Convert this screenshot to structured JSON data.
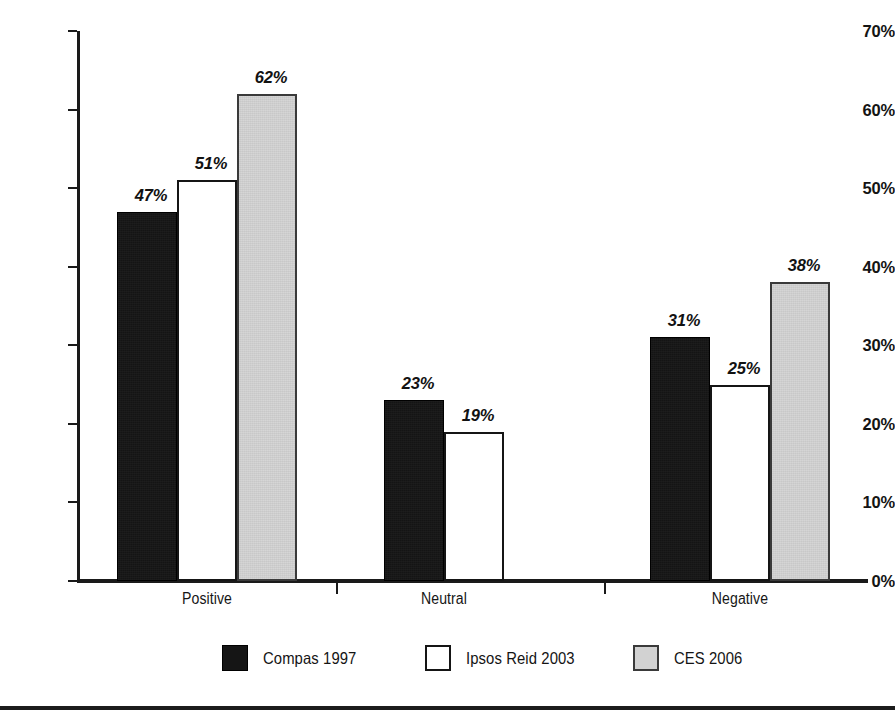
{
  "chart_data": {
    "type": "bar",
    "title": "",
    "subtitle": "",
    "xlabel": "",
    "ylabel": "",
    "categories": [
      "Positive",
      "Neutral",
      "Negative"
    ],
    "ylim": [
      0,
      70
    ],
    "y_tick_labels": [
      "0%",
      "10%",
      "20%",
      "30%",
      "40%",
      "50%",
      "60%",
      "70%"
    ],
    "y_tick_values": [
      0,
      10,
      20,
      30,
      40,
      50,
      60,
      70
    ],
    "y_axis_unit": "%",
    "grid": false,
    "legend_position": "bottom",
    "series": [
      {
        "name": "Compas 1997",
        "swatch": "black",
        "color": "#151515",
        "values": [
          47,
          51,
          31
        ],
        "labels": [
          "47%",
          "51%",
          "31%"
        ]
      },
      {
        "name": "Ipsos Reid 2003",
        "swatch": "white",
        "color": "#ffffff",
        "values": [
          51,
          19,
          25
        ],
        "labels": [
          "51%",
          "19%",
          "25%"
        ]
      },
      {
        "name": "CES 2006",
        "swatch": "gray",
        "color": "#d2d2d2",
        "values": [
          62,
          null,
          38
        ],
        "labels": [
          "62%",
          "",
          "38%"
        ]
      }
    ],
    "bars": [
      {
        "category": "Positive",
        "series": "Compas 1997",
        "value": 47,
        "label": "47%",
        "style": "black"
      },
      {
        "category": "Positive",
        "series": "Ipsos Reid 2003",
        "value": 51,
        "label": "51%",
        "style": "white"
      },
      {
        "category": "Positive",
        "series": "CES 2006",
        "value": 62,
        "label": "62%",
        "style": "gray"
      },
      {
        "category": "Neutral",
        "series": "Compas 1997",
        "value": 23,
        "label": "23%",
        "style": "black"
      },
      {
        "category": "Neutral",
        "series": "Ipsos Reid 2003",
        "value": 19,
        "label": "19%",
        "style": "white"
      },
      {
        "category": "Negative",
        "series": "Compas 1997",
        "value": 31,
        "label": "31%",
        "style": "black"
      },
      {
        "category": "Negative",
        "series": "Ipsos Reid 2003",
        "value": 25,
        "label": "25%",
        "style": "white"
      },
      {
        "category": "Negative",
        "series": "CES 2006",
        "value": 38,
        "label": "38%",
        "style": "gray"
      }
    ]
  },
  "axis": {
    "y_labels": [
      "70%",
      "60%",
      "50%",
      "40%",
      "30%",
      "20%",
      "10%",
      "0%"
    ],
    "x_labels": [
      "Positive",
      "Neutral",
      "Negative"
    ]
  },
  "legend": {
    "items": [
      {
        "label": "Compas 1997",
        "swatch": "black"
      },
      {
        "label": "Ipsos Reid 2003",
        "swatch": "white"
      },
      {
        "label": "CES 2006",
        "swatch": "gray"
      }
    ]
  }
}
